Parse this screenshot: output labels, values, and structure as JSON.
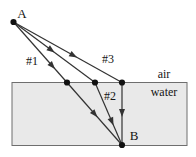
{
  "labels": {
    "source": "A",
    "receiver": "B",
    "ray1": "#1",
    "ray2": "#2",
    "ray3": "#3",
    "medium_top": "air",
    "medium_bottom": "water"
  },
  "colors": {
    "background": "#ffffff",
    "water_fill": "#e9e9e9",
    "box_border": "#6e6e6e",
    "ray": "#333333",
    "dot": "#111111",
    "text": "#141414"
  },
  "geometry": {
    "canvas": {
      "width": 196,
      "height": 157
    },
    "water_box": {
      "x": 12,
      "y": 82.5,
      "width": 175,
      "height": 63
    },
    "points": {
      "A": [
        13.5,
        22
      ],
      "P1": [
        67,
        82.5
      ],
      "P2": [
        95,
        82.5
      ],
      "P3": [
        122,
        82.5
      ],
      "B": [
        122,
        145
      ]
    },
    "dot_radius": 3.1,
    "ray_stroke_width": 1.2,
    "rays": [
      {
        "name": "ray-1",
        "via": "P1",
        "air_arrow_t": 0.72,
        "water_arrow_t": 0.5
      },
      {
        "name": "ray-2",
        "via": "P2",
        "air_arrow_t": 0.46,
        "water_arrow_t": 0.62
      },
      {
        "name": "ray-3",
        "via": "P3",
        "air_arrow_t": 0.55,
        "water_arrow_t": 0.48
      }
    ],
    "label_positions": {
      "source": [
        22,
        13
      ],
      "receiver": [
        134,
        135
      ],
      "ray1": [
        32,
        61
      ],
      "ray2": [
        110,
        96
      ],
      "ray3": [
        108,
        59
      ],
      "medium_top": [
        164,
        74
      ],
      "medium_bottom": [
        164,
        92
      ]
    }
  }
}
